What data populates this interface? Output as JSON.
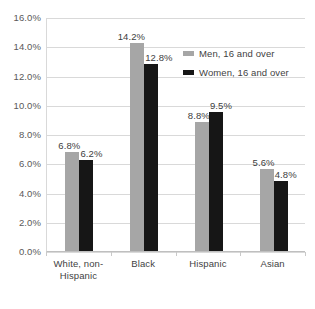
{
  "chart_data": {
    "type": "bar",
    "title": "",
    "subtitle": "",
    "xlabel": "",
    "ylabel": "",
    "categories": [
      "White, non-\nHispanic",
      "Black",
      "Hispanic",
      "Asian"
    ],
    "series": [
      {
        "name": "Men, 16 and over",
        "color": "#a6a6a6",
        "values": [
          6.8,
          14.2,
          8.8,
          5.6
        ],
        "value_labels": [
          "6.8%",
          "14.2%",
          "8.8%",
          "5.6%"
        ]
      },
      {
        "name": "Women, 16 and over",
        "color": "#161616",
        "values": [
          6.2,
          12.8,
          9.5,
          4.8
        ],
        "value_labels": [
          "6.2%",
          "12.8%",
          "9.5%",
          "4.8%"
        ]
      }
    ],
    "ylim": [
      0,
      16
    ],
    "ytick_values": [
      0,
      2,
      4,
      6,
      8,
      10,
      12,
      14,
      16
    ],
    "ytick_labels": [
      "0.0%",
      "2.0%",
      "4.0%",
      "6.0%",
      "8.0%",
      "10.0%",
      "12.0%",
      "14.0%",
      "16.0%"
    ],
    "grid": true,
    "grid_color": "#d9d9d9",
    "axis_color": "#bfbfbf",
    "legend_position": "inside-top-right",
    "background": "#ffffff"
  },
  "legend": {
    "items": [
      {
        "label": "Men, 16 and over",
        "swatch": "men"
      },
      {
        "label": "Women, 16 and over",
        "swatch": "women"
      }
    ]
  }
}
